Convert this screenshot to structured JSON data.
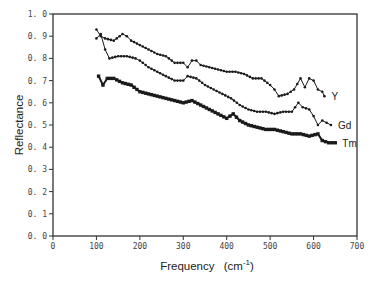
{
  "chart_data": {
    "type": "line",
    "title": "",
    "xlabel": "Frequency (cm⁻¹)",
    "xlabel_main": "Frequency",
    "xlabel_unit": "(cm",
    "xlabel_sup": "-1",
    "xlabel_close": ")",
    "ylabel": "Reflectance",
    "xlim": [
      0,
      700
    ],
    "ylim": [
      0.0,
      1.0
    ],
    "xticks": [
      "0",
      "100",
      "200",
      "300",
      "400",
      "500",
      "600",
      "700"
    ],
    "yticks": [
      "0.0",
      "0.1",
      "0.2",
      "0.3",
      "0.4",
      "0.5",
      "0.6",
      "0.7",
      "0.8",
      "0.9",
      "1.0"
    ],
    "grid": false,
    "legend_position": "inline labels at right end of each series",
    "series": [
      {
        "name": "Y",
        "marker": "small-dot",
        "x": [
          100,
          110,
          120,
          140,
          160,
          170,
          180,
          200,
          220,
          240,
          260,
          280,
          300,
          310,
          320,
          330,
          340,
          360,
          380,
          400,
          420,
          440,
          460,
          480,
          500,
          510,
          520,
          540,
          555,
          570,
          580,
          590,
          600,
          610,
          620,
          625
        ],
        "values": [
          0.93,
          0.9,
          0.89,
          0.88,
          0.91,
          0.9,
          0.88,
          0.86,
          0.84,
          0.82,
          0.81,
          0.78,
          0.78,
          0.76,
          0.79,
          0.79,
          0.77,
          0.76,
          0.75,
          0.74,
          0.74,
          0.73,
          0.71,
          0.71,
          0.68,
          0.66,
          0.63,
          0.64,
          0.66,
          0.71,
          0.67,
          0.71,
          0.7,
          0.66,
          0.65,
          0.63
        ]
      },
      {
        "name": "Gd",
        "marker": "small-dot",
        "x": [
          100,
          110,
          120,
          130,
          150,
          170,
          190,
          200,
          220,
          240,
          260,
          280,
          300,
          310,
          330,
          350,
          370,
          390,
          410,
          430,
          450,
          470,
          490,
          510,
          530,
          550,
          565,
          575,
          590,
          600,
          610,
          620,
          630,
          640
        ],
        "values": [
          0.89,
          0.91,
          0.84,
          0.8,
          0.81,
          0.81,
          0.8,
          0.79,
          0.76,
          0.74,
          0.72,
          0.7,
          0.7,
          0.72,
          0.71,
          0.68,
          0.66,
          0.64,
          0.62,
          0.59,
          0.57,
          0.56,
          0.56,
          0.55,
          0.56,
          0.56,
          0.6,
          0.58,
          0.57,
          0.54,
          0.5,
          0.52,
          0.51,
          0.5
        ]
      },
      {
        "name": "Tm",
        "marker": "filled-square",
        "x": [
          105,
          115,
          125,
          140,
          160,
          180,
          200,
          220,
          240,
          260,
          280,
          300,
          320,
          340,
          360,
          380,
          400,
          415,
          430,
          450,
          470,
          490,
          510,
          530,
          550,
          570,
          590,
          610,
          620,
          635,
          650
        ],
        "values": [
          0.72,
          0.68,
          0.71,
          0.71,
          0.69,
          0.68,
          0.65,
          0.64,
          0.63,
          0.62,
          0.61,
          0.6,
          0.61,
          0.59,
          0.57,
          0.55,
          0.53,
          0.55,
          0.52,
          0.5,
          0.49,
          0.48,
          0.48,
          0.47,
          0.46,
          0.46,
          0.45,
          0.46,
          0.43,
          0.42,
          0.42
        ]
      }
    ]
  },
  "colors": {
    "line": "#1a1a1a",
    "axis": "#333333",
    "background": "#ffffff"
  }
}
